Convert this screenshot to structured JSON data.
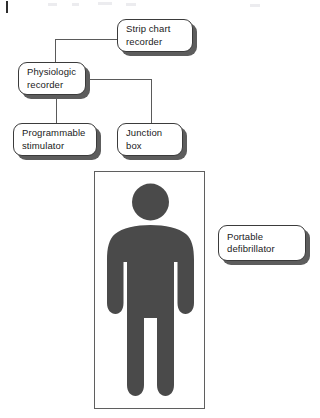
{
  "diagram": {
    "type": "block-diagram",
    "colors": {
      "box_fill": "#ffffff",
      "box_border": "#3b3b3b",
      "box_shadow": "#5d5d5d",
      "connector": "#5a5a5a",
      "figure_fill": "#4a4a4a",
      "frame_border": "#5f5f5f",
      "page_background": "#ffffff"
    },
    "nodes": [
      {
        "id": "strip-chart-recorder",
        "label": "Strip chart\nrecorder"
      },
      {
        "id": "physiologic-recorder",
        "label": "Physiologic\nrecorder"
      },
      {
        "id": "programmable-stimulator",
        "label": "Programmable\nstimulator"
      },
      {
        "id": "junction-box",
        "label": "Junction\nbox"
      },
      {
        "id": "portable-defibrillator",
        "label": "Portable\ndefibrillator"
      }
    ],
    "connections": [
      {
        "from": "physiologic-recorder",
        "to": "strip-chart-recorder"
      },
      {
        "from": "physiologic-recorder",
        "to": "programmable-stimulator"
      },
      {
        "from": "physiologic-recorder",
        "to": "junction-box"
      }
    ],
    "patient_panel": {
      "id": "patient-panel",
      "figure": "standing-person-pictogram",
      "label": ""
    },
    "page_marks": {
      "margin_rule": "|"
    }
  }
}
